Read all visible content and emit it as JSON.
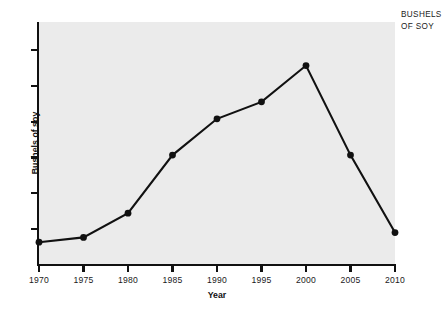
{
  "corner_caption": {
    "line1": "BUSHELS",
    "line2": "OF SOY"
  },
  "chart_data": {
    "type": "line",
    "title": "",
    "xlabel": "Year",
    "ylabel": "Bushels of soy",
    "categories": [
      1970,
      1975,
      1980,
      1985,
      1990,
      1995,
      2000,
      2005,
      2010
    ],
    "x_tick_labels": [
      "1970",
      "1975",
      "1980",
      "1985",
      "1990",
      "1995",
      "2000",
      "2005",
      "2010"
    ],
    "y_tick_labels": [],
    "values": [
      9,
      11,
      21,
      45,
      60,
      67,
      82,
      45,
      13
    ],
    "xlim": [
      1970,
      2010
    ],
    "ylim": [
      0,
      100
    ],
    "grid": false,
    "legend": null,
    "marker": "filled-circle",
    "series_color": "#111111",
    "plot_background": "#ebebeb",
    "page_background": "#ffffff",
    "annotations": [
      "BUSHELS OF SOY"
    ],
    "y_tick_count": 6
  }
}
